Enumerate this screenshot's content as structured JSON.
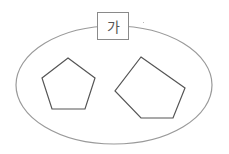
{
  "diagram": {
    "set_label": "가",
    "colors": {
      "ellipse": "#9a9a9a",
      "shape": "#555555",
      "label_border": "#8a8a8a"
    },
    "shapes": [
      {
        "type": "pentagon",
        "orientation": "regular-upright",
        "points": "68,58 95,78 85,109 52,109 42,78"
      },
      {
        "type": "pentagon",
        "orientation": "tilted-irregular",
        "points": "141,57 185,88 173,118 141,118 115,91"
      }
    ]
  }
}
